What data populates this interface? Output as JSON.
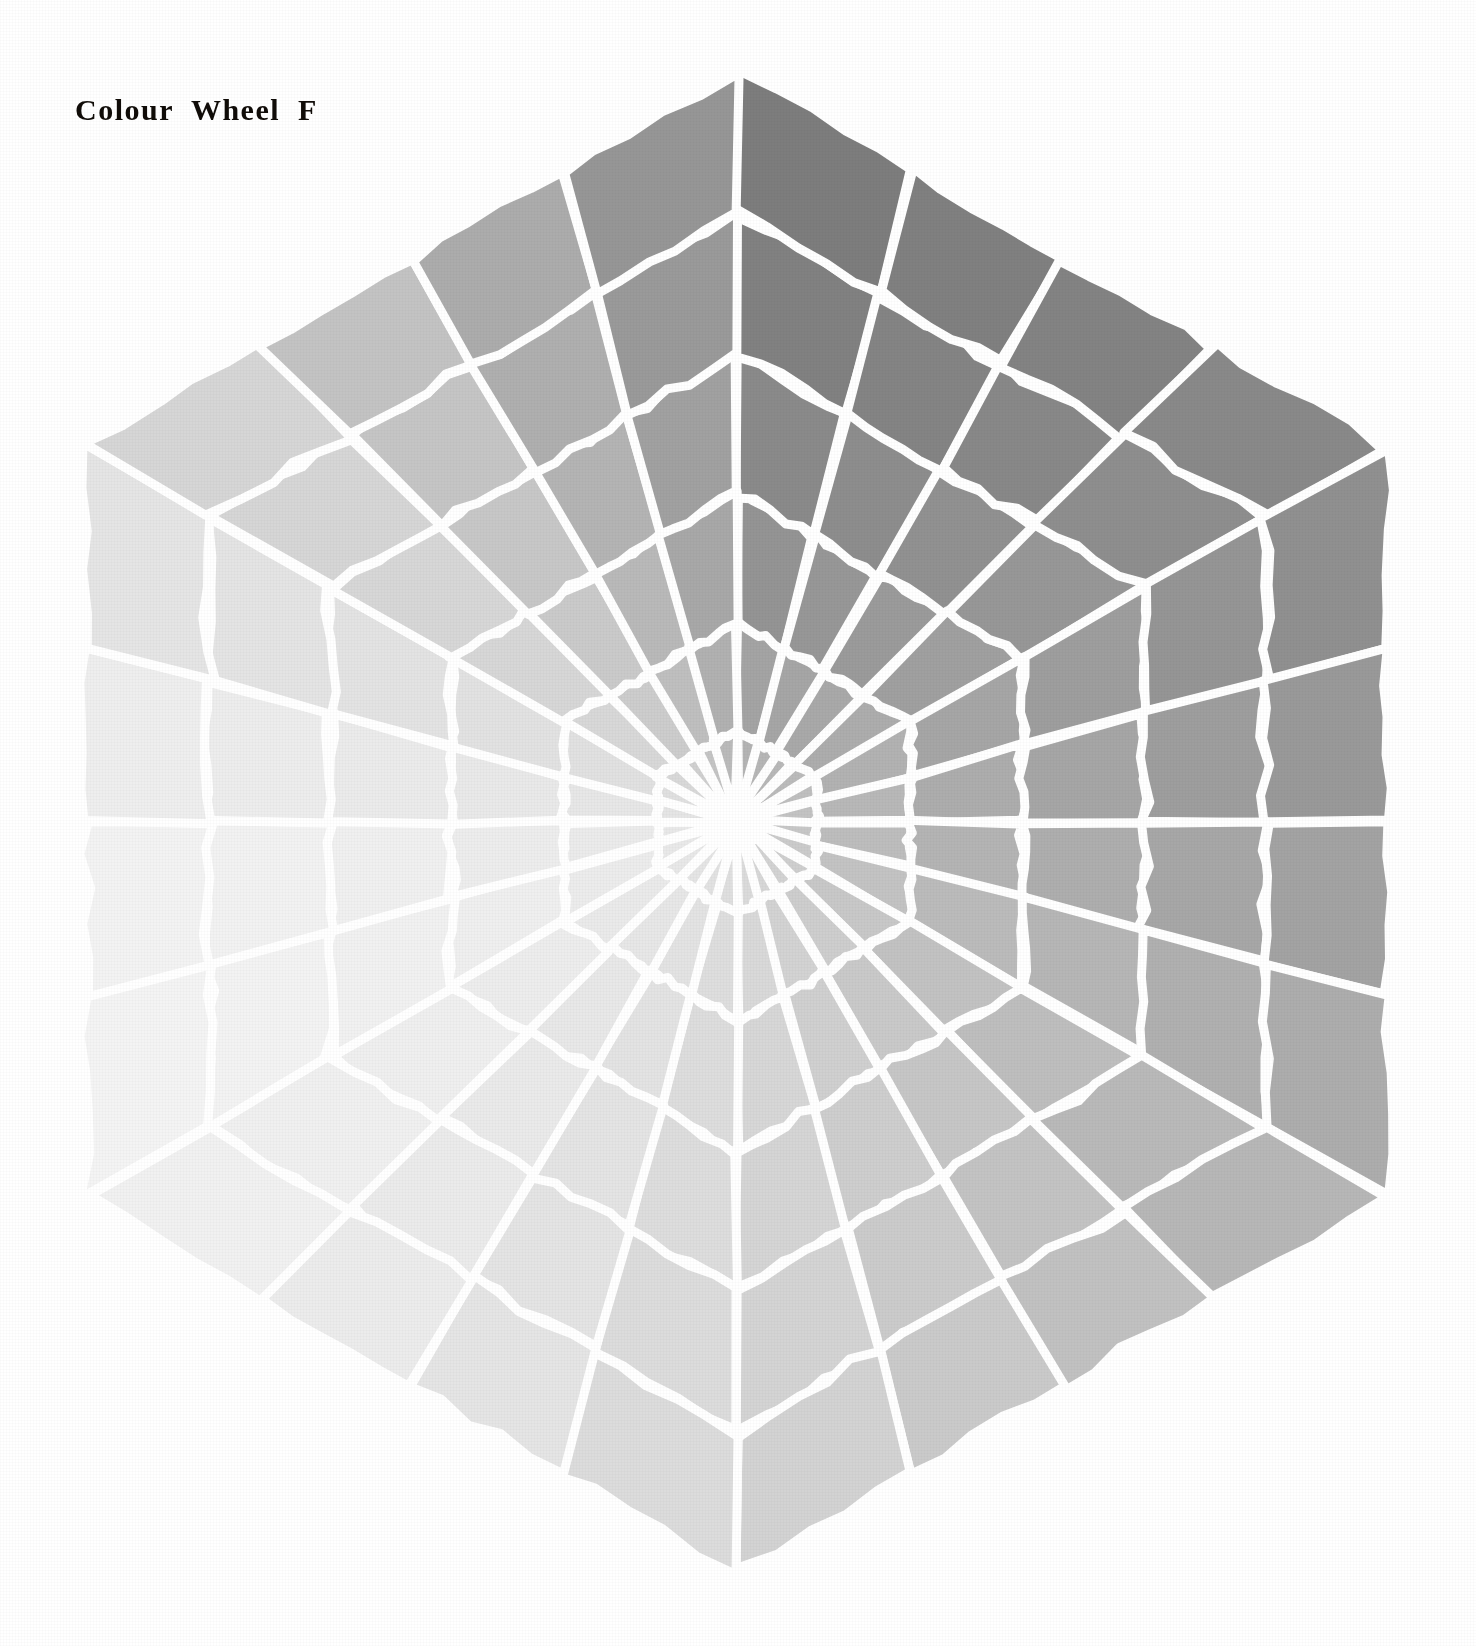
{
  "page": {
    "background_color": "#ffffff",
    "width": 1476,
    "height": 1646
  },
  "title": {
    "text": "Colour  Wheel  F",
    "color": "#100c08"
  },
  "wheel": {
    "shape": "hexagon",
    "center_x": 737,
    "center_y": 822,
    "outer_radius": 752,
    "hub_radius": 26,
    "hub_color": "#ffffff",
    "grid_line_color": "#ffffff",
    "grid_line_width": 9,
    "sectors": 24,
    "rings": 6,
    "ring_radii": [
      26,
      92,
      200,
      330,
      470,
      610,
      752
    ],
    "rotation_deg": -90,
    "sector_labels": [
      "sector-01",
      "sector-02",
      "sector-03",
      "sector-04",
      "sector-05",
      "sector-06",
      "sector-07",
      "sector-08",
      "sector-09",
      "sector-10",
      "sector-11",
      "sector-12",
      "sector-13",
      "sector-14",
      "sector-15",
      "sector-16",
      "sector-17",
      "sector-18",
      "sector-19",
      "sector-20",
      "sector-21",
      "sector-22",
      "sector-23",
      "sector-24"
    ],
    "ring_labels": [
      "ring-1-inner",
      "ring-2",
      "ring-3",
      "ring-4",
      "ring-5",
      "ring-6-outer"
    ]
  },
  "chart_data": {
    "type": "heatmap",
    "title": "Colour  Wheel  F",
    "xlabel": "",
    "ylabel": "",
    "grid": true,
    "legend": "none",
    "angular_axis": {
      "count": 24,
      "start_deg": -90,
      "step_deg": 15,
      "labels": [
        "0",
        "15",
        "30",
        "45",
        "60",
        "75",
        "90",
        "105",
        "120",
        "135",
        "150",
        "165",
        "180",
        "195",
        "210",
        "225",
        "240",
        "255",
        "270",
        "285",
        "300",
        "315",
        "330",
        "345"
      ]
    },
    "radial_axis": {
      "count": 6,
      "labels": [
        "1",
        "2",
        "3",
        "4",
        "5",
        "6"
      ],
      "inner_radius": 26,
      "outer_radius": 752
    },
    "value_unit": "grey-level-hex",
    "cells": [
      {
        "sector": 0,
        "values": [
          "#b4b4b4",
          "#a4a4a4",
          "#949494",
          "#8a8a8a",
          "#818181",
          "#7d7d7d"
        ]
      },
      {
        "sector": 1,
        "values": [
          "#b6b6b6",
          "#a6a6a6",
          "#979797",
          "#8d8d8d",
          "#848484",
          "#808080"
        ]
      },
      {
        "sector": 2,
        "values": [
          "#b8b8b8",
          "#a9a9a9",
          "#9b9b9b",
          "#919191",
          "#888888",
          "#838383"
        ]
      },
      {
        "sector": 3,
        "values": [
          "#bbbbbb",
          "#adadad",
          "#a0a0a0",
          "#979797",
          "#8e8e8e",
          "#898989"
        ]
      },
      {
        "sector": 4,
        "values": [
          "#bfbfbf",
          "#b2b2b2",
          "#a6a6a6",
          "#9e9e9e",
          "#959595",
          "#909090"
        ]
      },
      {
        "sector": 5,
        "values": [
          "#c3c3c3",
          "#b8b8b8",
          "#adadad",
          "#a6a6a6",
          "#9e9e9e",
          "#999999"
        ]
      },
      {
        "sector": 6,
        "values": [
          "#c7c7c7",
          "#bdbdbd",
          "#b4b4b4",
          "#aeaeae",
          "#a7a7a7",
          "#a3a3a3"
        ]
      },
      {
        "sector": 7,
        "values": [
          "#cbcbcb",
          "#c3c3c3",
          "#bbbbbb",
          "#b6b6b6",
          "#b0b0b0",
          "#adadad"
        ]
      },
      {
        "sector": 8,
        "values": [
          "#cfcfcf",
          "#c8c8c8",
          "#c2c2c2",
          "#bebebe",
          "#b9b9b9",
          "#b7b7b7"
        ]
      },
      {
        "sector": 9,
        "values": [
          "#d3d3d3",
          "#cecece",
          "#c9c9c9",
          "#c6c6c6",
          "#c3c3c3",
          "#c1c1c1"
        ]
      },
      {
        "sector": 10,
        "values": [
          "#d7d7d7",
          "#d3d3d3",
          "#d0d0d0",
          "#cecece",
          "#cbcbcb",
          "#cacaca"
        ]
      },
      {
        "sector": 11,
        "values": [
          "#dbdbdb",
          "#d9d9d9",
          "#d7d7d7",
          "#d5d5d5",
          "#d4d4d4",
          "#d3d3d3"
        ]
      },
      {
        "sector": 12,
        "values": [
          "#dfdfdf",
          "#dedede",
          "#dddddd",
          "#dddddd",
          "#dcdcdc",
          "#dcdcdc"
        ]
      },
      {
        "sector": 13,
        "values": [
          "#e2e2e2",
          "#e3e3e3",
          "#e3e3e3",
          "#e4e4e4",
          "#e4e4e4",
          "#e5e5e5"
        ]
      },
      {
        "sector": 14,
        "values": [
          "#e5e5e5",
          "#e7e7e7",
          "#e8e8e8",
          "#eaeaea",
          "#ebebeb",
          "#ececec"
        ]
      },
      {
        "sector": 15,
        "values": [
          "#e8e8e8",
          "#eaeaea",
          "#ededed",
          "#efefef",
          "#f0f0f0",
          "#f1f1f1"
        ]
      },
      {
        "sector": 16,
        "values": [
          "#e9e9e9",
          "#ececec",
          "#efefef",
          "#f1f1f1",
          "#f3f3f3",
          "#f4f4f4"
        ]
      },
      {
        "sector": 17,
        "values": [
          "#e8e8e8",
          "#ebebeb",
          "#ededed",
          "#f0f0f0",
          "#f2f2f2",
          "#f3f3f3"
        ]
      },
      {
        "sector": 18,
        "values": [
          "#e5e5e5",
          "#e7e7e7",
          "#e9e9e9",
          "#ebebeb",
          "#ededed",
          "#eeeeee"
        ]
      },
      {
        "sector": 19,
        "values": [
          "#e0e0e0",
          "#e1e1e1",
          "#e2e2e2",
          "#e3e3e3",
          "#e4e4e4",
          "#e5e5e5"
        ]
      },
      {
        "sector": 20,
        "values": [
          "#d9d9d9",
          "#d8d8d8",
          "#d7d7d7",
          "#d7d7d7",
          "#d6d6d6",
          "#d6d6d6"
        ]
      },
      {
        "sector": 21,
        "values": [
          "#d0d0d0",
          "#cdcdcd",
          "#cacaca",
          "#c7c7c7",
          "#c5c5c5",
          "#c3c3c3"
        ]
      },
      {
        "sector": 22,
        "values": [
          "#c4c4c4",
          "#bfbfbf",
          "#b9b9b9",
          "#b4b4b4",
          "#afafaf",
          "#acacac"
        ]
      },
      {
        "sector": 23,
        "values": [
          "#bababa",
          "#b1b1b1",
          "#a8a8a8",
          "#a1a1a1",
          "#9a9a9a",
          "#969696"
        ]
      }
    ]
  }
}
